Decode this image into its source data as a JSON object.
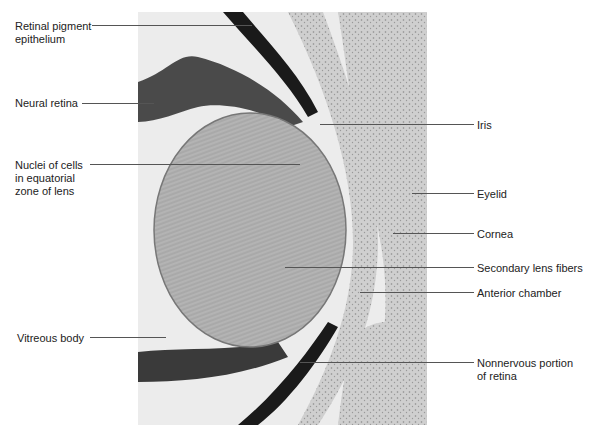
{
  "figure": {
    "labels_left": [
      {
        "id": "retinal-pigment-epithelium",
        "text": "Retinal pigment\nepithelium"
      },
      {
        "id": "neural-retina",
        "text": "Neural retina"
      },
      {
        "id": "nuclei-equatorial-zone",
        "text": "Nuclei of cells\nin equatorial\nzone of lens"
      },
      {
        "id": "vitreous-body",
        "text": "Vitreous body"
      }
    ],
    "labels_right": [
      {
        "id": "iris",
        "text": "Iris"
      },
      {
        "id": "eyelid",
        "text": "Eyelid"
      },
      {
        "id": "cornea",
        "text": "Cornea"
      },
      {
        "id": "secondary-lens-fibers",
        "text": "Secondary lens fibers"
      },
      {
        "id": "anterior-chamber",
        "text": "Anterior chamber"
      },
      {
        "id": "nonnervous-portion-retina",
        "text": "Nonnervous portion\nof retina"
      }
    ]
  }
}
